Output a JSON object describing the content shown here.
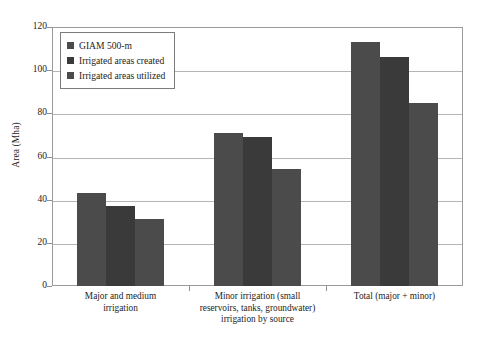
{
  "chart_data": {
    "type": "bar",
    "title": "",
    "xlabel": "",
    "ylabel": "Area (Mha)",
    "ylim": [
      0,
      120
    ],
    "yticks": [
      0,
      20,
      40,
      60,
      80,
      100,
      120
    ],
    "ytick_labels": [
      "0",
      "20",
      "40",
      "60",
      "80",
      "100",
      "120"
    ],
    "grid": true,
    "legend_position": "upper left (inside axes)",
    "categories": [
      "Major and medium irrigation",
      "Minor irrigation (small reservoirs, tanks, groundwater) irrigation by source",
      "Total (major + minor)"
    ],
    "category_label_lines": [
      [
        "Major and medium",
        "irrigation"
      ],
      [
        "Minor irrigation (small",
        "reservoirs, tanks, groundwater)",
        "irrigation by source"
      ],
      [
        "Total (major + minor)"
      ]
    ],
    "series": [
      {
        "name": "GIAM 500-m",
        "values": [
          43,
          71,
          113
        ],
        "color": "#4b4b4b"
      },
      {
        "name": "Irrigated areas created",
        "values": [
          37,
          69,
          106
        ],
        "color": "#3a3a3a"
      },
      {
        "name": "Irrigated areas utilized",
        "values": [
          31,
          54,
          85
        ],
        "color": "#4b4b4b"
      }
    ]
  },
  "axes": {
    "y_title": "Area (Mha)"
  },
  "legend": {
    "items": [
      {
        "label": "GIAM 500-m",
        "color": "#4b4b4b"
      },
      {
        "label": "Irrigated areas created",
        "color": "#3a3a3a"
      },
      {
        "label": "Irrigated areas utilized",
        "color": "#4b4b4b"
      }
    ]
  },
  "style": {
    "background": "#ffffff",
    "frame_color": "#9a9a9a",
    "gridline_color": "#b4b4b4",
    "text_color": "#1d1d1d"
  }
}
